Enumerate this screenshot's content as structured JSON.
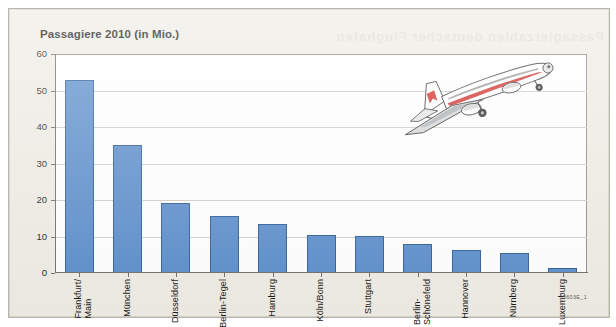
{
  "figure": {
    "title": "Passagiere 2010 (in Mio.)",
    "source_code": "15603E_1",
    "ghost_text": "Passagierzahlen deutscher Flughafen",
    "illustration": "airplane-taking-off"
  },
  "colors": {
    "bar_fill": "#5b8ecb",
    "bar_stroke": "#2f5c94",
    "paper_background": "#efece4",
    "plot_background": "#ffffff",
    "gridline": "#cfcdc7",
    "axis": "#6f6d68",
    "plane_accent_red": "#d2322d",
    "plane_accent_gray": "#8a8a8a"
  },
  "chart_data": {
    "type": "bar",
    "title": "Passagiere 2010 (in Mio.)",
    "xlabel": "",
    "ylabel": "",
    "ylim": [
      0,
      60
    ],
    "yticks": [
      0,
      10,
      20,
      30,
      40,
      50,
      60
    ],
    "grid": true,
    "legend": false,
    "categories": [
      "Frankfurt/\nMain",
      "München",
      "Düsseldorf",
      "Berlin-Tegel",
      "Hamburg",
      "Köln/Bonn",
      "Stuttgart",
      "Berlin-\nSchönefeld",
      "Hannover",
      "Nürnberg",
      "Luxemburg"
    ],
    "values": [
      53.0,
      35.0,
      19.3,
      15.5,
      13.5,
      10.5,
      10.1,
      8.0,
      6.2,
      5.4,
      1.5
    ]
  }
}
